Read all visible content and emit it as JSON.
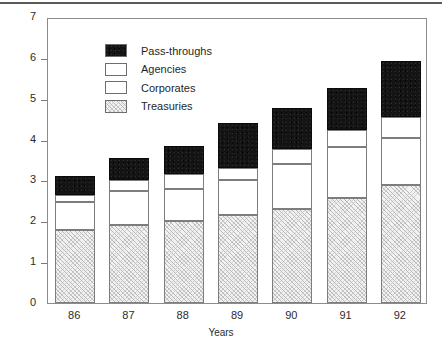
{
  "chart_data": {
    "type": "bar",
    "stacked": true,
    "title": "",
    "xlabel": "Years",
    "ylabel": "$ in Trillions",
    "categories": [
      "86",
      "87",
      "88",
      "89",
      "90",
      "91",
      "92"
    ],
    "ylim": [
      0,
      7
    ],
    "yticks": [
      "0",
      "1",
      "2",
      "3",
      "4",
      "5",
      "6",
      "7"
    ],
    "grid": false,
    "legend_position": "upper-left inside",
    "series": [
      {
        "name": "Treasuries",
        "values": [
          1.79,
          1.92,
          2.01,
          2.16,
          2.31,
          2.58,
          2.9
        ],
        "swatch": "hatched-gray"
      },
      {
        "name": "Corporates",
        "values": [
          0.69,
          0.83,
          0.79,
          0.84,
          1.1,
          1.25,
          1.15
        ],
        "swatch": "white-dotted"
      },
      {
        "name": "Agencies",
        "values": [
          0.17,
          0.25,
          0.35,
          0.3,
          0.37,
          0.4,
          0.5
        ],
        "swatch": "white"
      },
      {
        "name": "Pass-throughs",
        "values": [
          0.47,
          0.56,
          0.7,
          1.1,
          0.99,
          1.03,
          1.37
        ],
        "swatch": "black"
      }
    ],
    "totals": [
      3.12,
      3.56,
      3.85,
      4.4,
      4.77,
      5.26,
      5.92
    ]
  },
  "legend": {
    "items": [
      {
        "label": "Pass-throughs"
      },
      {
        "label": "Agencies"
      },
      {
        "label": "Corporates"
      },
      {
        "label": "Treasuries"
      }
    ]
  },
  "axes": {
    "y_title": "$ in Trillions",
    "x_title": "Years"
  }
}
